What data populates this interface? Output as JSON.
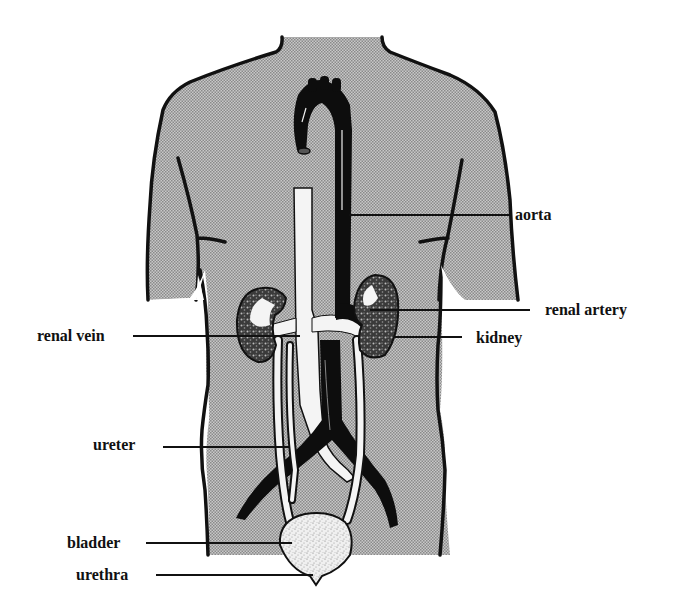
{
  "figure": {
    "colors": {
      "background": "#ffffff",
      "body_fill": "#b3b3b3",
      "outline": "#111111",
      "vessel_dark": "#0d0d0d",
      "vein_light": "#f4f4f4",
      "bladder_fill": "#e6e6e6",
      "kidney_fill": "#5a5a5a",
      "label_text": "#111111"
    }
  },
  "labels": {
    "aorta": "aorta",
    "renal_artery": "renal artery",
    "kidney": "kidney",
    "renal_vein": "renal vein",
    "ureter": "ureter",
    "bladder": "bladder",
    "urethra": "urethra"
  }
}
